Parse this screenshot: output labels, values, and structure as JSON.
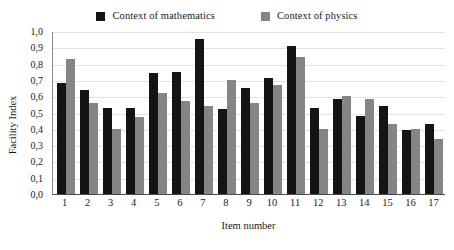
{
  "chart_data": {
    "type": "bar",
    "title": "",
    "subtitle": "",
    "xlabel": "Item number",
    "ylabel": "Facility Index",
    "ylim": [
      0,
      1.0
    ],
    "ytick_step": 0.1,
    "grid": true,
    "decimal_separator": ",",
    "legend_position": "top-center",
    "categories": [
      "1",
      "2",
      "3",
      "4",
      "5",
      "6",
      "7",
      "8",
      "9",
      "10",
      "11",
      "12",
      "13",
      "14",
      "15",
      "16",
      "17"
    ],
    "ytick_labels": [
      "1,0",
      "0,9",
      "0,8",
      "0,7",
      "0,6",
      "0,5",
      "0,4",
      "0,3",
      "0,2",
      "0,1",
      "0,0"
    ],
    "ytick_values": [
      1.0,
      0.9,
      0.8,
      0.7,
      0.6,
      0.5,
      0.4,
      0.3,
      0.2,
      0.1,
      0.0
    ],
    "series": [
      {
        "name": "Context of mathematics",
        "color": "#141414",
        "values": [
          0.68,
          0.64,
          0.53,
          0.53,
          0.74,
          0.75,
          0.95,
          0.52,
          0.65,
          0.71,
          0.91,
          0.53,
          0.58,
          0.48,
          0.54,
          0.39,
          0.43
        ]
      },
      {
        "name": "Context of physics",
        "color": "#858585",
        "values": [
          0.83,
          0.56,
          0.4,
          0.47,
          0.62,
          0.57,
          0.54,
          0.7,
          0.56,
          0.67,
          0.84,
          0.4,
          0.6,
          0.58,
          0.43,
          0.4,
          0.34
        ]
      }
    ]
  },
  "legend": {
    "items": [
      {
        "label": "Context of mathematics",
        "swatch": "black-square-swatch"
      },
      {
        "label": "Context of physics",
        "swatch": "gray-square-swatch"
      }
    ]
  },
  "axes": {
    "y_title": "Facility Index",
    "x_title": "Item number"
  }
}
